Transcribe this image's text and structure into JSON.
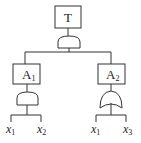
{
  "diagram": {
    "type": "fault-tree",
    "top_event": {
      "label": "T",
      "gate": "AND"
    },
    "intermediate_events": [
      {
        "label": "A",
        "subscript": "1",
        "gate": "AND",
        "children": [
          {
            "label": "x",
            "subscript": "1"
          },
          {
            "label": "x",
            "subscript": "2"
          }
        ]
      },
      {
        "label": "A",
        "subscript": "2",
        "gate": "OR",
        "children": [
          {
            "label": "x",
            "subscript": "1"
          },
          {
            "label": "x",
            "subscript": "3"
          }
        ]
      }
    ]
  }
}
